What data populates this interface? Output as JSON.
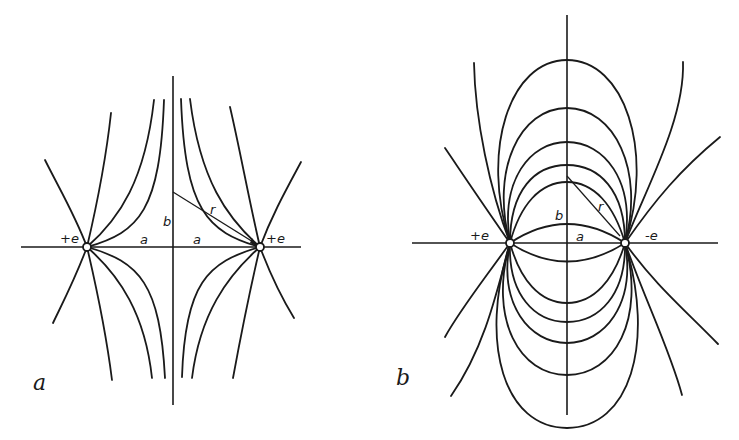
{
  "figure": {
    "panels": [
      {
        "id": "a",
        "caption": "a",
        "description": "Field lines of two equal positive charges",
        "charges": [
          {
            "label": "+e",
            "x": 87,
            "y": 247
          },
          {
            "label": "+e",
            "x": 260,
            "y": 247
          }
        ],
        "labels": {
          "half_separation_left": "a",
          "half_separation_right": "a",
          "height": "b",
          "distance": "r"
        }
      },
      {
        "id": "b",
        "caption": "b",
        "description": "Field lines of an electric dipole (positive and negative charge)",
        "charges": [
          {
            "label": "+e",
            "x": 510,
            "y": 243
          },
          {
            "label": "-e",
            "x": 625,
            "y": 243
          }
        ],
        "labels": {
          "half_separation": "a",
          "height": "b",
          "distance": "r"
        }
      }
    ]
  }
}
